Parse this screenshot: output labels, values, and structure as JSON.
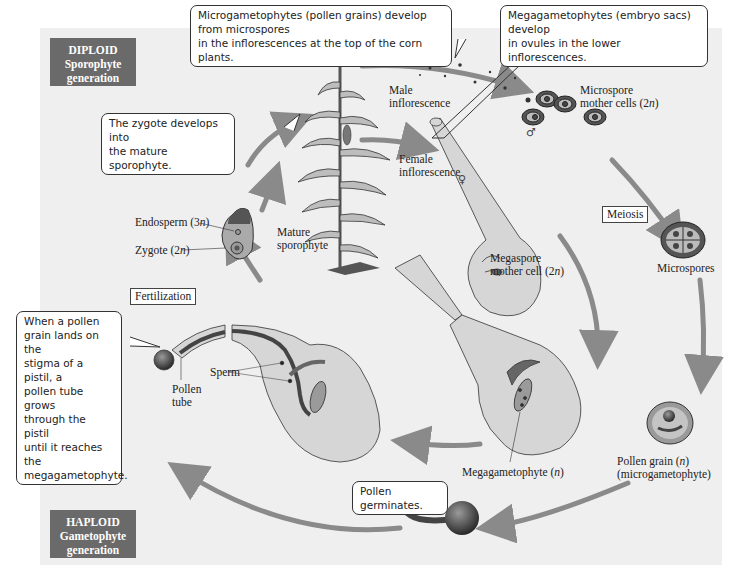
{
  "generations": {
    "diploid": {
      "line1": "DIPLOID",
      "line2": "Sporophyte",
      "line3": "generation"
    },
    "haploid": {
      "line1": "HAPLOID",
      "line2": "Gametophyte",
      "line3": "generation"
    }
  },
  "callouts": {
    "microgametophytes": {
      "line1": "Microgametophytes (pollen grains) develop from microspores",
      "line2": "in the inflorescences at the top of the corn plants."
    },
    "megagametophytes": {
      "line1": "Megagametophytes (embryo sacs) develop",
      "line2": "in ovules in the lower inflorescences."
    },
    "zygote": {
      "line1": "The zygote develops into",
      "line2": "the mature sporophyte."
    },
    "pollen_tube": {
      "lines": [
        "When a pollen",
        "grain lands on the",
        "stigma of a pistil, a",
        "pollen tube grows",
        "through the pistil",
        "until it reaches the",
        "megagametophyte."
      ]
    },
    "germinates": {
      "text": "Pollen germinates."
    }
  },
  "labels": {
    "male_inflorescence": {
      "line1": "Male",
      "line2": "inflorescence"
    },
    "female_inflorescence": {
      "line1": "Female",
      "line2": "inflorescence"
    },
    "microspore_mother": {
      "line1": "Microspore",
      "line2_pre": "mother cells (2",
      "n": "n",
      "close": ")"
    },
    "megaspore_mother": {
      "line1": "Megaspore",
      "line2_pre": "mother cell (2",
      "n": "n",
      "close": ")"
    },
    "microspores": "Microspores",
    "mature_sporophyte": {
      "line1": "Mature",
      "line2": "sporophyte"
    },
    "endosperm": {
      "pre": "Endosperm (3",
      "n": "n",
      "close": ")"
    },
    "zygote": {
      "pre": "Zygote (2",
      "n": "n",
      "close": ")"
    },
    "pollen_tube": {
      "line1": "Pollen",
      "line2": "tube"
    },
    "sperm": "Sperm",
    "megagametophyte": {
      "pre": "Megagametophyte (",
      "n": "n",
      "close": ")"
    },
    "pollen_grain": {
      "pre": "Pollen grain (",
      "n": "n",
      "close": ")",
      "line2": "(microgametophyte)"
    }
  },
  "process_boxes": {
    "meiosis": "Meiosis",
    "fertilization": "Fertilization"
  },
  "symbols": {
    "male": "♂",
    "female": "♀"
  },
  "colors": {
    "panel": "#efefef",
    "gen_box": "#6a6a6a",
    "arrow": "#8a8a8a",
    "tissue": "#d6d6d6",
    "dark_tissue": "#5a5a5a"
  }
}
